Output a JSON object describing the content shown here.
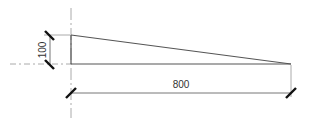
{
  "diagram": {
    "type": "dimensioned-taper-drawing",
    "dimensions": {
      "height": {
        "label": "100"
      },
      "length": {
        "label": "800"
      }
    },
    "colors": {
      "outline": "#555555",
      "centerline": "#aaaaaa",
      "tick": "#111111",
      "text": "#333333"
    }
  }
}
